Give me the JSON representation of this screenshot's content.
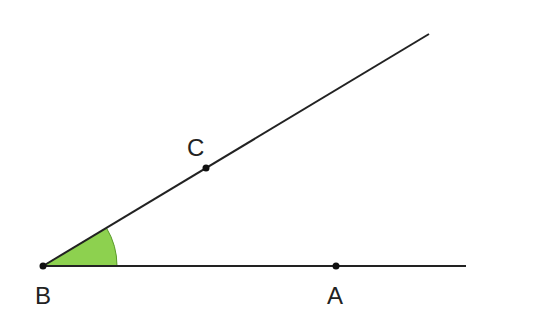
{
  "diagram": {
    "type": "geometry-angle",
    "points": {
      "B": {
        "label": "B",
        "x": 43,
        "y": 266
      },
      "A": {
        "label": "A",
        "x": 336,
        "y": 266
      },
      "C": {
        "label": "C",
        "x": 206,
        "y": 168
      }
    },
    "rays": [
      {
        "from": "B",
        "through": "A",
        "end": [
          466,
          266
        ]
      },
      {
        "from": "B",
        "through": "C",
        "end": [
          429,
          34
        ]
      }
    ],
    "angle": {
      "vertex": "B",
      "between": [
        "A",
        "C"
      ],
      "fill": "#8dd14f",
      "radius": 74
    },
    "colors": {
      "line": "#222222",
      "point": "#111111",
      "angle_fill": "#8dd14f"
    }
  }
}
